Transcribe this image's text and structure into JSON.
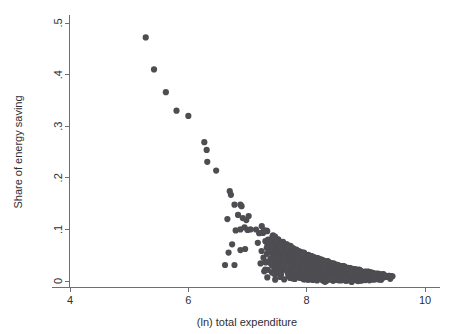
{
  "chart_data": {
    "type": "scatter",
    "title": "",
    "xlabel": "(ln) total expenditure",
    "ylabel": "Share of energy saving",
    "xlim": [
      3.7,
      10.25
    ],
    "ylim": [
      -0.012,
      0.515
    ],
    "xticks": [
      4,
      6,
      8,
      10
    ],
    "xticklabels": [
      "4",
      "6",
      "8",
      "10"
    ],
    "yticks": [
      0,
      0.1,
      0.2,
      0.3,
      0.4,
      0.5
    ],
    "yticklabels": [
      "0",
      ".1",
      ".2",
      ".3",
      ".4",
      ".5"
    ],
    "grid": false,
    "legend": null,
    "marker": {
      "shape": "circle",
      "color": "#4d4d52",
      "size": 3.1
    },
    "series": [
      {
        "name": "households",
        "description": "Share of energy saving vs (ln) total expenditure; sparse high-share outliers at low expenditure, dense hyperbolic cloud above x=7 decaying toward 0.",
        "points": [
          [
            5.28,
            0.472
          ],
          [
            5.42,
            0.41
          ],
          [
            5.62,
            0.366
          ],
          [
            5.8,
            0.33
          ],
          [
            6.0,
            0.32
          ],
          [
            6.27,
            0.269
          ],
          [
            6.31,
            0.254
          ],
          [
            6.32,
            0.231
          ],
          [
            6.47,
            0.214
          ],
          [
            6.7,
            0.174
          ],
          [
            6.72,
            0.167
          ],
          [
            6.78,
            0.148
          ],
          [
            6.88,
            0.148
          ],
          [
            6.9,
            0.145
          ],
          [
            6.66,
            0.12
          ],
          [
            6.84,
            0.128
          ],
          [
            6.92,
            0.122
          ],
          [
            6.98,
            0.118
          ],
          [
            7.02,
            0.126
          ],
          [
            6.8,
            0.098
          ],
          [
            6.88,
            0.1
          ],
          [
            6.95,
            0.104
          ],
          [
            7.0,
            0.099
          ],
          [
            7.05,
            0.1
          ],
          [
            6.74,
            0.071
          ],
          [
            6.68,
            0.055
          ],
          [
            6.88,
            0.06
          ],
          [
            6.96,
            0.062
          ],
          [
            6.62,
            0.031
          ],
          [
            6.78,
            0.031
          ],
          [
            7.22,
            0.034
          ],
          [
            7.3,
            0.022
          ],
          [
            7.62,
            0.003
          ],
          [
            7.72,
            0.006
          ],
          [
            7.8,
            0.004
          ],
          [
            7.9,
            0.008
          ],
          [
            9.28,
            0.01
          ],
          [
            9.32,
            0.011
          ],
          [
            9.45,
            0.009
          ]
        ],
        "cloud": {
          "description": "Dense cloud: x in [7.05, 9.55]; y distributed from 0 up to an upper envelope approximately 0.126*exp(-1.45*(x-7.05)) plus jitter.",
          "n_points": 2400,
          "x_range": [
            7.05,
            9.55
          ],
          "envelope_y_at_x": [
            [
              7.05,
              0.126
            ],
            [
              7.25,
              0.104
            ],
            [
              7.5,
              0.082
            ],
            [
              7.75,
              0.064
            ],
            [
              8.0,
              0.05
            ],
            [
              8.25,
              0.039
            ],
            [
              8.5,
              0.03
            ],
            [
              8.75,
              0.023
            ],
            [
              9.0,
              0.017
            ],
            [
              9.25,
              0.013
            ],
            [
              9.55,
              0.009
            ]
          ]
        }
      }
    ]
  },
  "figure": {
    "background": "#ffffff",
    "axis_color": "#6e6e73",
    "text_color": "#2e2e33",
    "point_color": "#4d4d52"
  }
}
